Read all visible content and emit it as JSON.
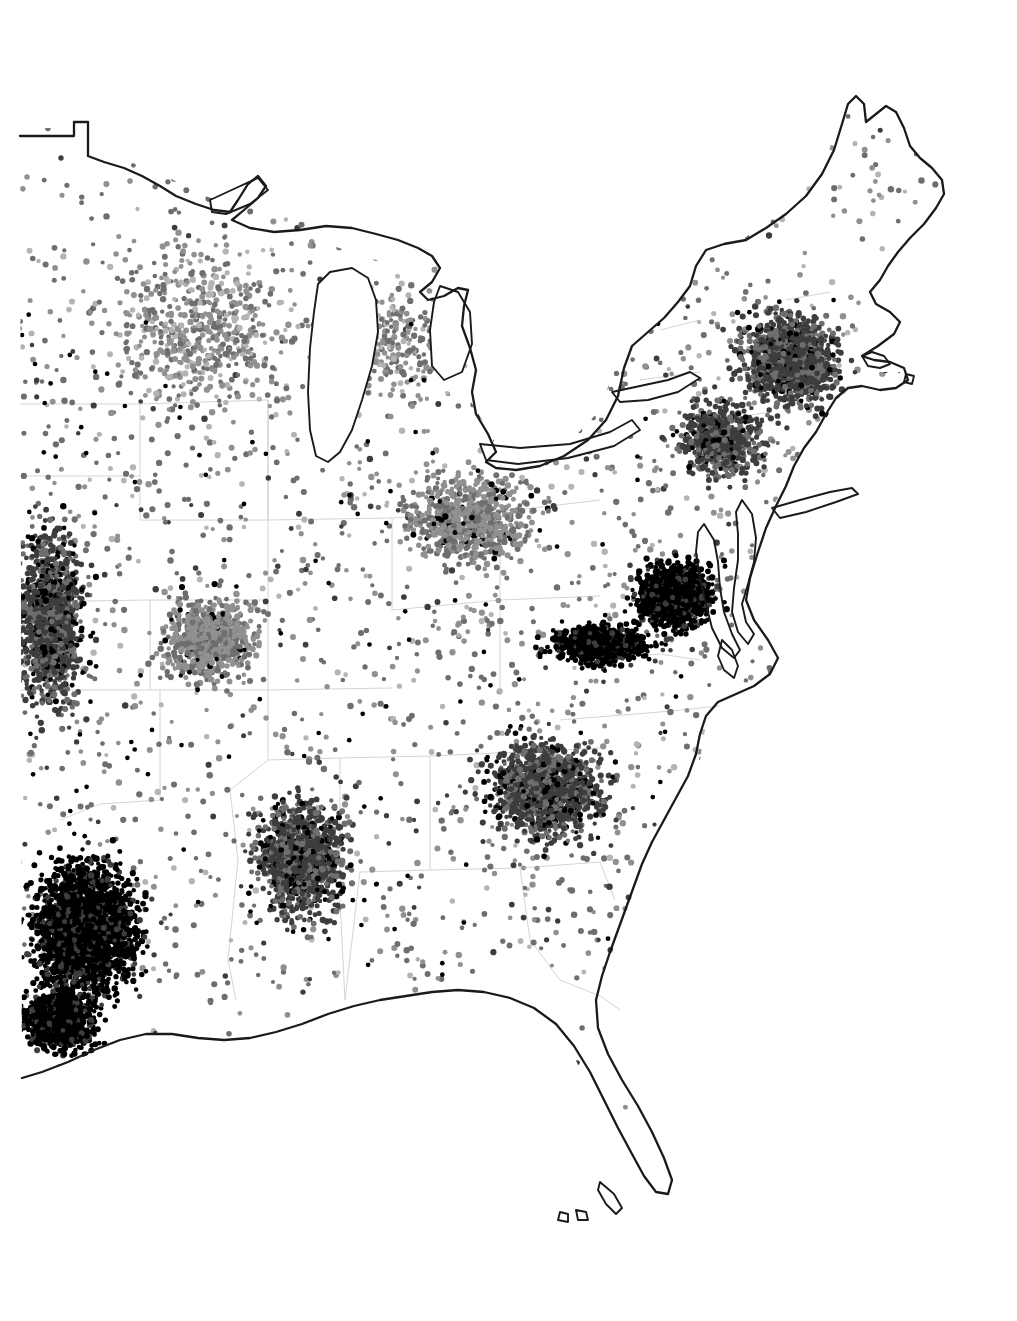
{
  "figure": {
    "kind": "dot-density-map",
    "region_name": "Eastern United States",
    "background_color": "#ffffff",
    "outline_color": "#1a1a1a",
    "state_boundary_color": "#cfcfcf",
    "has_title": false,
    "has_legend": false,
    "has_axes": false,
    "has_scalebar": false,
    "has_north_arrow": false,
    "visible_text": []
  },
  "chart_data": {
    "type": "scatter",
    "title": "",
    "subtitle": "",
    "xlabel": "",
    "ylabel": "",
    "legend_position": "none",
    "grid": false,
    "projection_hint": "unprojected-raster-extent",
    "xlim": [
      0,
      1017
    ],
    "ylim": [
      0,
      1321
    ],
    "point_shape": "circle",
    "point_radius_px": 2.6,
    "dot_shades": [
      "#000000",
      "#3d3d3d",
      "#6e6e6e",
      "#909090",
      "#b4b4b4"
    ],
    "series": [
      {
        "name": "very-high-density",
        "color": "#000000",
        "values": [
          6200
        ]
      },
      {
        "name": "high-density",
        "color": "#4a4a4a",
        "values": [
          9400
        ]
      },
      {
        "name": "medium-density",
        "color": "#787878",
        "values": [
          14800
        ]
      },
      {
        "name": "low-density",
        "color": "#a0a0a0",
        "values": [
          7600
        ]
      }
    ],
    "density_regions": [
      {
        "label": "East Texas / Louisiana",
        "cx": 85,
        "cy": 930,
        "rx": 85,
        "ry": 105,
        "density": 1.0,
        "shade": "#000000",
        "n": 2600
      },
      {
        "label": "Southern Louisiana",
        "cx": 60,
        "cy": 1020,
        "rx": 60,
        "ry": 55,
        "density": 0.92,
        "shade": "#0d0d0d",
        "n": 900
      },
      {
        "label": "Virginia Piedmont",
        "cx": 675,
        "cy": 595,
        "rx": 60,
        "ry": 52,
        "density": 0.95,
        "shade": "#0a0a0a",
        "n": 1300
      },
      {
        "label": "Southern Virginia Belt",
        "cx": 600,
        "cy": 645,
        "rx": 85,
        "ry": 30,
        "density": 0.85,
        "shade": "#1c1c1c",
        "n": 900
      },
      {
        "label": "Mississippi / Alabama",
        "cx": 300,
        "cy": 860,
        "rx": 75,
        "ry": 95,
        "density": 0.7,
        "shade": "#5a5a5a",
        "n": 1700
      },
      {
        "label": "Carolinas Piedmont",
        "cx": 545,
        "cy": 790,
        "rx": 95,
        "ry": 85,
        "density": 0.68,
        "shade": "#6a6a6a",
        "n": 1750
      },
      {
        "label": "Great Plains Margin",
        "cx": 50,
        "cy": 620,
        "rx": 60,
        "ry": 150,
        "density": 0.66,
        "shade": "#6e6e6e",
        "n": 1600
      },
      {
        "label": "Ozarks / Missouri",
        "cx": 210,
        "cy": 640,
        "rx": 80,
        "ry": 70,
        "density": 0.58,
        "shade": "#767676",
        "n": 1200
      },
      {
        "label": "Ohio Valley",
        "cx": 470,
        "cy": 520,
        "rx": 110,
        "ry": 75,
        "density": 0.5,
        "shade": "#808080",
        "n": 1400
      },
      {
        "label": "Northeast Megalopolis",
        "cx": 790,
        "cy": 360,
        "rx": 80,
        "ry": 80,
        "density": 0.72,
        "shade": "#5f5f5f",
        "n": 1600
      },
      {
        "label": "Mid-Atlantic Corridor",
        "cx": 720,
        "cy": 440,
        "rx": 70,
        "ry": 60,
        "density": 0.62,
        "shade": "#6a6a6a",
        "n": 1000
      },
      {
        "label": "Upper Midwest",
        "cx": 200,
        "cy": 330,
        "rx": 160,
        "ry": 140,
        "density": 0.34,
        "shade": "#909090",
        "n": 1500
      },
      {
        "label": "Michigan",
        "cx": 400,
        "cy": 340,
        "rx": 70,
        "ry": 90,
        "density": 0.3,
        "shade": "#969696",
        "n": 600
      },
      {
        "label": "Appalachian Gap",
        "cx": 470,
        "cy": 620,
        "rx": 70,
        "ry": 60,
        "density": 0.12,
        "shade": "#a8a8a8",
        "n": 160
      },
      {
        "label": "Florida Peninsula",
        "cx": 635,
        "cy": 1070,
        "rx": 55,
        "ry": 90,
        "density": 0.06,
        "shade": "#b0b0b0",
        "n": 130
      },
      {
        "label": "Maine",
        "cx": 875,
        "cy": 185,
        "rx": 55,
        "ry": 75,
        "density": 0.09,
        "shade": "#a4a4a4",
        "n": 150
      }
    ],
    "annotations": []
  }
}
